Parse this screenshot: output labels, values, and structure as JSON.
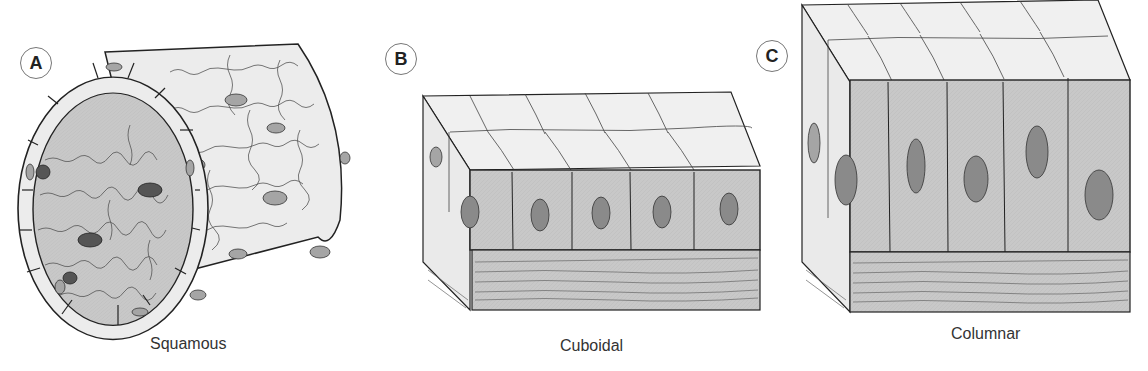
{
  "figure": {
    "panels": [
      {
        "id": "A",
        "letter": "A",
        "caption": "Squamous"
      },
      {
        "id": "B",
        "letter": "B",
        "caption": "Cuboidal"
      },
      {
        "id": "C",
        "letter": "C",
        "caption": "Columnar"
      }
    ]
  },
  "colors": {
    "outer_cell": "#ebebeb",
    "inner_cell": "#c6c6c6",
    "nucleus_light": "#a5a5a5",
    "nucleus_dark": "#555555",
    "nucleus_mid": "#8a8a8a",
    "stroke": "#222222",
    "basement": "#cfcfcf"
  }
}
